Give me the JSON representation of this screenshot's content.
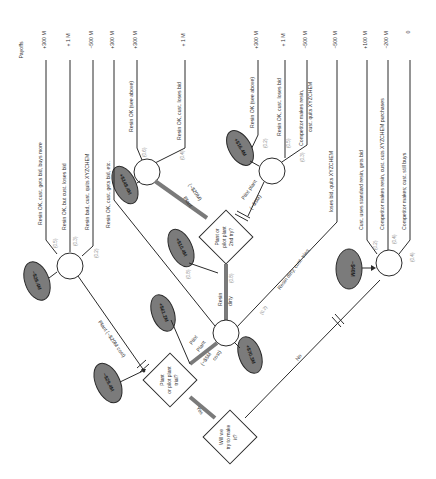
{
  "payoffs_header": "Payoffs",
  "payoffs": [
    "+300 M",
    "+ 1 M",
    "−500 M",
    "+300 M",
    "+300 M",
    "+ 1 M",
    "+300 M",
    "+ 1 M",
    "−500 M",
    "−500 M",
    "+100 M",
    "−200 M",
    "0"
  ],
  "decisions": {
    "make": [
      "Will we",
      "try to make",
      "it?"
    ],
    "trial": [
      "Plant",
      "or pilot plant",
      "trial?"
    ],
    "second": [
      "Plant or",
      "pilot plant",
      "2nd try?"
    ]
  },
  "branches": {
    "yes": "Yes",
    "no": "No",
    "plant_first": "Plant (~$20M cost)",
    "pilot_first_1": "Pilot",
    "pilot_first_2": "Plant",
    "pilot_first_3": "(~$5M",
    "pilot_first_4": "cost)",
    "resin_dirty_1": "Resin",
    "resin_dirty_2": "dirty",
    "plant_second_1": "Plant",
    "plant_second_2": "(~$20M)",
    "pilot_second_1": "Pilot plant",
    "pilot_second_2": "(~$5M)",
    "resin_ok_etc": "Resin OK, cust. gets bid, etc.",
    "resin_dirty_tries": "Resin dirty, cust. tries,",
    "loses_bid": "loses bid, quits XYZCHEM"
  },
  "outcomes": {
    "a1": "Resin OK, cust. gets bid, buys more",
    "a2": "Resin OK, but cust. loses bid",
    "a3": "Resin bad, cust. quits XYZCHEM",
    "b1": "Resin OK (see above)",
    "b2": "Resin OK, cust. loses bid",
    "c1": "Resin OK (see above)",
    "c2": "Resin OK, cust. loses bid",
    "c3a": "Competitor makes resin,",
    "c3b": "cust. quits XYZCHEM",
    "d1": "Cust. uses standard resin, gets bid",
    "d2": "Competitor makes resin, cust. cuts XYZCHEM purchases",
    "d3": "Competitor makes; cust. still buys"
  },
  "probabilities": {
    "a": [
      "(0.5)",
      "(0.3)",
      "(0.2)"
    ],
    "b": [
      "(0.6)",
      "(0.4)"
    ],
    "c": [
      "(0.2)",
      "(0.5)",
      "(0.3)"
    ],
    "mid": [
      "(0.8)",
      "(0.2)"
    ],
    "dirty": "(0.8)",
    "d": [
      "(0.2)",
      "(0.4)",
      "(0.4)"
    ]
  },
  "expected_values": {
    "a": "−$28.4M",
    "b": "+$148.4M",
    "c": "+$16.4M",
    "second": "+$10.4M",
    "mid_left": "+$61.2M",
    "mid_right": "+$70.3M",
    "trial": "−$29.4M",
    "d": "−$40M"
  }
}
